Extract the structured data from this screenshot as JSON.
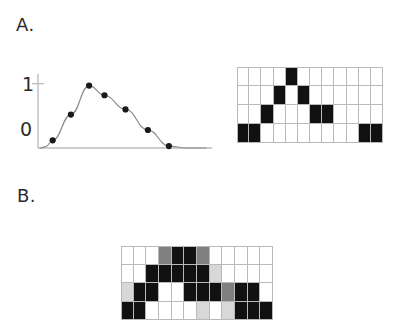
{
  "figure": {
    "panels": [
      {
        "id": "A",
        "label": "A."
      },
      {
        "id": "B",
        "label": "B."
      }
    ],
    "colors": {
      "ink": "#1a1a1a",
      "grid_line": "#b9b9b9",
      "curve": "#8c8c8c",
      "axis": "#bdbdbd",
      "cell_on": "#111111",
      "cell_off": "#ffffff",
      "cell_mid": "#808080",
      "cell_light": "#d8d8d8"
    }
  },
  "chart_data": {
    "type": "line",
    "title": "",
    "xlabel": "",
    "ylabel": "",
    "grid": false,
    "legend": "none",
    "xlim": [
      0,
      12
    ],
    "ylim": [
      0,
      1.15
    ],
    "ytick_labels": [
      "0",
      "1"
    ],
    "ytick_values": [
      0,
      1
    ],
    "xtick_labels": [],
    "series": [
      {
        "name": "signal",
        "marker": "filled-circle",
        "line_style": "smooth",
        "x": [
          1,
          2,
          3,
          4,
          5,
          6,
          7,
          8,
          9,
          10,
          11,
          12
        ],
        "values": [
          0.0,
          0.12,
          0.52,
          0.97,
          0.84,
          0.62,
          0.6,
          0.6,
          0.28,
          0.03,
          0.0,
          0.0
        ],
        "points": [
          {
            "x": 1.05,
            "y": 0.12
          },
          {
            "x": 2.35,
            "y": 0.52
          },
          {
            "x": 3.65,
            "y": 0.97
          },
          {
            "x": 4.75,
            "y": 0.82
          },
          {
            "x": 6.25,
            "y": 0.6
          },
          {
            "x": 7.85,
            "y": 0.28
          },
          {
            "x": 9.35,
            "y": 0.03
          }
        ]
      }
    ]
  },
  "grid_a": {
    "rows": 4,
    "cols": 12,
    "legend": {
      "0": "empty",
      "1": "filled"
    },
    "cells": [
      [
        0,
        0,
        0,
        0,
        1,
        0,
        0,
        0,
        0,
        0,
        0,
        0
      ],
      [
        0,
        0,
        0,
        1,
        0,
        1,
        0,
        0,
        0,
        0,
        0,
        0
      ],
      [
        0,
        0,
        1,
        0,
        0,
        0,
        1,
        1,
        0,
        0,
        0,
        0
      ],
      [
        1,
        1,
        0,
        0,
        0,
        0,
        0,
        0,
        0,
        0,
        1,
        1
      ]
    ]
  },
  "grid_b": {
    "rows": 4,
    "cols": 12,
    "legend": {
      "0": "empty",
      "1": "filled",
      "2": "mid-gray",
      "3": "light-gray"
    },
    "cells": [
      [
        0,
        0,
        0,
        2,
        1,
        1,
        2,
        0,
        0,
        0,
        0,
        0
      ],
      [
        0,
        0,
        1,
        1,
        1,
        1,
        1,
        3,
        0,
        0,
        0,
        0
      ],
      [
        3,
        1,
        1,
        0,
        0,
        1,
        1,
        1,
        2,
        1,
        1,
        0
      ],
      [
        1,
        1,
        0,
        0,
        0,
        0,
        3,
        0,
        3,
        1,
        1,
        1
      ]
    ]
  }
}
